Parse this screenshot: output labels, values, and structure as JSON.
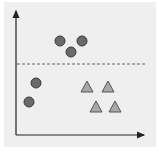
{
  "diagram": {
    "title": "",
    "colors": {
      "background": "#efefef",
      "axis": "#222222",
      "circle_fill": "#6a6a6a",
      "circle_stroke": "#3a3a3a",
      "triangle_fill": "#a8a8a8",
      "triangle_stroke": "#555555",
      "dashed_line": "#666666"
    },
    "axes": {
      "x_label": "",
      "y_label": ""
    },
    "separator": {
      "style": "dashed",
      "orientation": "horizontal"
    },
    "circles": [
      {
        "cx": 60,
        "cy": 41
      },
      {
        "cx": 82,
        "cy": 41
      },
      {
        "cx": 71,
        "cy": 52
      },
      {
        "cx": 36,
        "cy": 83
      },
      {
        "cx": 29,
        "cy": 102
      }
    ],
    "triangles": [
      {
        "cx": 87,
        "cy": 87
      },
      {
        "cx": 108,
        "cy": 87
      },
      {
        "cx": 96,
        "cy": 107
      },
      {
        "cx": 115,
        "cy": 107
      }
    ]
  }
}
